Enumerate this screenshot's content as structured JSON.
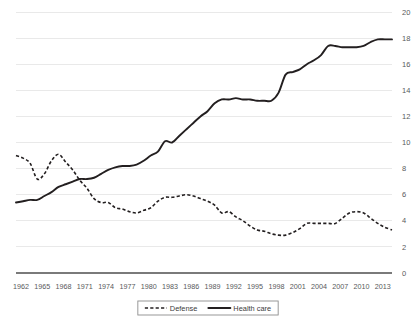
{
  "chart_data": {
    "type": "line",
    "title": "",
    "subtitle": "",
    "xlabel": "",
    "ylabel": "",
    "xlim": [
      1962,
      2015
    ],
    "ylim": [
      0,
      20
    ],
    "ytick_values": [
      0,
      2,
      4,
      6,
      8,
      10,
      12,
      14,
      16,
      18,
      20
    ],
    "ytick_labels": [
      "0",
      "2",
      "4",
      "6",
      "8",
      "10",
      "12",
      "14",
      "16",
      "18",
      "20"
    ],
    "xtick_labels": [
      "1962",
      "1965",
      "1968",
      "1971",
      "1974",
      "1977",
      "1980",
      "1983",
      "1986",
      "1989",
      "1992",
      "1995",
      "1998",
      "2001",
      "2004",
      "2007",
      "2010",
      "2013"
    ],
    "xtick_values": [
      1962,
      1965,
      1968,
      1971,
      1974,
      1977,
      1980,
      1983,
      1986,
      1989,
      1992,
      1995,
      1998,
      2001,
      2004,
      2007,
      2010,
      2013
    ],
    "grid": "horizontal",
    "legend_position": "bottom-center",
    "x": [
      1962,
      1963,
      1964,
      1965,
      1966,
      1967,
      1968,
      1969,
      1970,
      1971,
      1972,
      1973,
      1974,
      1975,
      1976,
      1977,
      1978,
      1979,
      1980,
      1981,
      1982,
      1983,
      1984,
      1985,
      1986,
      1987,
      1988,
      1989,
      1990,
      1991,
      1992,
      1993,
      1994,
      1995,
      1996,
      1997,
      1998,
      1999,
      2000,
      2001,
      2002,
      2003,
      2004,
      2005,
      2006,
      2007,
      2008,
      2009,
      2010,
      2011,
      2012,
      2013,
      2014,
      2015
    ],
    "series": [
      {
        "name": "Defense",
        "style": "dashed",
        "color": "#231f20",
        "values": [
          9.0,
          8.8,
          8.4,
          7.2,
          7.6,
          8.6,
          9.1,
          8.5,
          7.9,
          7.1,
          6.5,
          5.7,
          5.4,
          5.4,
          5.0,
          4.9,
          4.7,
          4.6,
          4.8,
          5.0,
          5.5,
          5.8,
          5.8,
          5.9,
          6.0,
          5.9,
          5.7,
          5.5,
          5.2,
          4.6,
          4.7,
          4.3,
          4.0,
          3.6,
          3.3,
          3.2,
          3.0,
          2.9,
          2.9,
          3.1,
          3.4,
          3.8,
          3.8,
          3.8,
          3.8,
          3.8,
          4.2,
          4.6,
          4.7,
          4.6,
          4.2,
          3.8,
          3.5,
          3.3
        ]
      },
      {
        "name": "Health care",
        "style": "solid",
        "color": "#231f20",
        "values": [
          5.4,
          5.5,
          5.6,
          5.6,
          5.9,
          6.2,
          6.6,
          6.8,
          7.0,
          7.2,
          7.2,
          7.3,
          7.6,
          7.9,
          8.1,
          8.2,
          8.2,
          8.3,
          8.6,
          9.0,
          9.3,
          10.1,
          10.0,
          10.5,
          11.0,
          11.5,
          12.0,
          12.4,
          13.0,
          13.3,
          13.3,
          13.4,
          13.3,
          13.3,
          13.2,
          13.2,
          13.2,
          13.8,
          15.2,
          15.4,
          15.6,
          16.0,
          16.3,
          16.7,
          17.4,
          17.4,
          17.3,
          17.3,
          17.3,
          17.4,
          17.7,
          17.9,
          17.9,
          17.9
        ]
      }
    ]
  },
  "legend": {
    "items": [
      {
        "label": "Defense",
        "style": "dashed"
      },
      {
        "label": "Health care",
        "style": "solid"
      }
    ]
  }
}
